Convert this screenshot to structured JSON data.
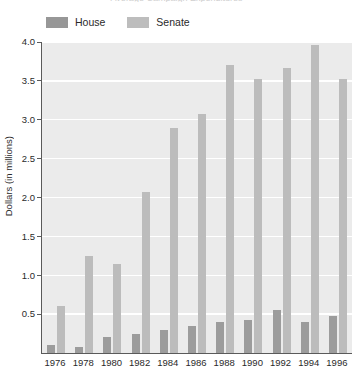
{
  "chart_data": {
    "type": "bar",
    "title": "Average Campaign Expenditures",
    "categories": [
      "1976",
      "1978",
      "1980",
      "1982",
      "1984",
      "1986",
      "1988",
      "1990",
      "1992",
      "1994",
      "1996"
    ],
    "series": [
      {
        "name": "House",
        "color": "#9c9c9c",
        "values": [
          0.1,
          0.08,
          0.2,
          0.25,
          0.3,
          0.35,
          0.4,
          0.42,
          0.55,
          0.4,
          0.47
        ]
      },
      {
        "name": "Senate",
        "color": "#bcbcbc",
        "values": [
          0.6,
          1.25,
          1.15,
          2.07,
          2.9,
          3.07,
          3.71,
          3.52,
          3.67,
          3.96,
          3.53
        ]
      }
    ],
    "xlabel": "",
    "ylabel": "Dollars (in millions)",
    "ylim": [
      0.0,
      4.0
    ],
    "ytick_labels": [
      "0.5",
      "1.0",
      "1.5",
      "2.0",
      "2.5",
      "3.0",
      "3.5",
      "4.0"
    ],
    "ytick_values": [
      0.5,
      1.0,
      1.5,
      2.0,
      2.5,
      3.0,
      3.5,
      4.0
    ],
    "grid": true,
    "legend_position": "top-left",
    "plot_background": "#ebebeb",
    "gridline_color": "#ffffff"
  },
  "legend": {
    "items": [
      {
        "label": "House",
        "color": "#9c9c9c"
      },
      {
        "label": "Senate",
        "color": "#bcbcbc"
      }
    ]
  },
  "axes": {
    "y_title": "Dollars (in millions)"
  }
}
